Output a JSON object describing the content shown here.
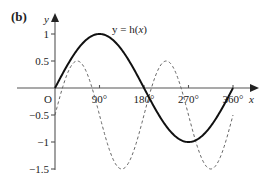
{
  "panel_label": "(b)",
  "curve_label": {
    "prefix": "y = h(",
    "var": "x",
    "suffix": ")"
  },
  "axes": {
    "x_label": "x",
    "y_label": "y",
    "origin_label": "O"
  },
  "colors": {
    "solid": "#111111",
    "dashed": "#666666",
    "axis": "#555555"
  },
  "chart_data": {
    "type": "line",
    "title": "",
    "xlabel": "x",
    "ylabel": "y",
    "xlim": [
      0,
      360
    ],
    "ylim": [
      -1.5,
      1
    ],
    "x_ticks": [
      {
        "value": 90,
        "label": "90°"
      },
      {
        "value": 180,
        "label": "180°"
      },
      {
        "value": 270,
        "label": "270°"
      },
      {
        "value": 360,
        "label": "360°"
      }
    ],
    "y_ticks": [
      {
        "value": 1,
        "label": "1"
      },
      {
        "value": 0.5,
        "label": "0.5"
      },
      {
        "value": -0.5,
        "label": "−0.5"
      },
      {
        "value": -1,
        "label": "−1"
      },
      {
        "value": -1.5,
        "label": "−1.5"
      }
    ],
    "grid": false,
    "annotations": [
      "y = h(x)"
    ],
    "series": [
      {
        "name": "y = h(x)",
        "style": "solid",
        "x": [
          0,
          45,
          90,
          135,
          180,
          225,
          270,
          315,
          360
        ],
        "values": [
          0,
          0.71,
          1,
          0.71,
          0,
          -0.71,
          -1,
          -0.71,
          0
        ]
      },
      {
        "name": "dashed curve",
        "style": "dashed",
        "x": [
          0,
          45,
          90,
          135,
          180,
          225,
          270,
          315,
          360
        ],
        "values": [
          -0.5,
          0.5,
          -0.5,
          -1.5,
          -0.5,
          0.5,
          -0.5,
          -1.5,
          -0.5
        ]
      }
    ]
  }
}
